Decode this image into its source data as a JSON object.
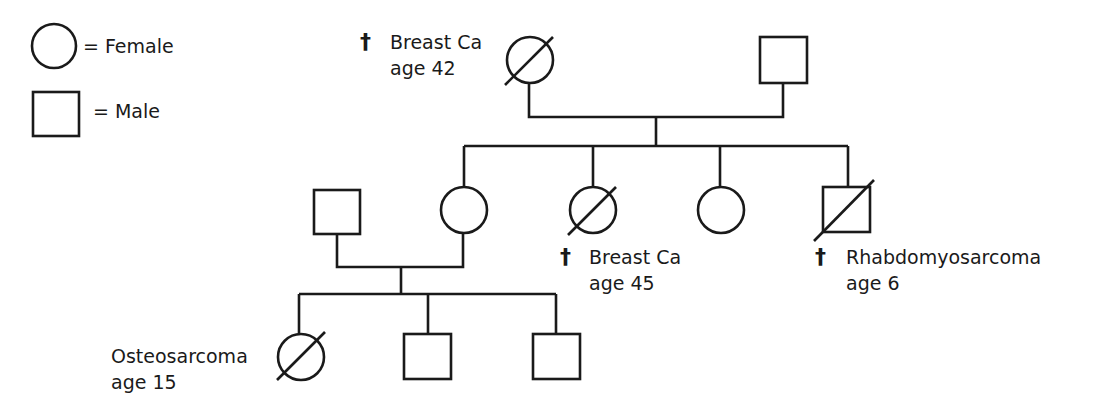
{
  "legend": {
    "female": {
      "symbol": "circle",
      "label": "= Female"
    },
    "male": {
      "symbol": "square",
      "label": "= Male"
    }
  },
  "symbols": {
    "deceased_marker": "†"
  },
  "generations": [
    {
      "id": "I",
      "individuals": [
        {
          "id": "I-1",
          "sex": "female",
          "deceased": true,
          "affected_marker": "slash",
          "label1": "Breast Ca",
          "label2": "age 42"
        },
        {
          "id": "I-2",
          "sex": "male",
          "deceased": false
        }
      ]
    },
    {
      "id": "II",
      "individuals": [
        {
          "id": "II-spouse",
          "sex": "male",
          "deceased": false
        },
        {
          "id": "II-1",
          "sex": "female",
          "deceased": false
        },
        {
          "id": "II-2",
          "sex": "female",
          "deceased": true,
          "label1": "Breast Ca",
          "label2": "age 45"
        },
        {
          "id": "II-3",
          "sex": "female",
          "deceased": false
        },
        {
          "id": "II-4",
          "sex": "male",
          "deceased": true,
          "label1": "Rhabdomyosarcoma",
          "label2": "age 6"
        }
      ]
    },
    {
      "id": "III",
      "individuals": [
        {
          "id": "III-1",
          "sex": "female",
          "deceased": true,
          "label1": "Osteosarcoma",
          "label2": "age 15"
        },
        {
          "id": "III-2",
          "sex": "male",
          "deceased": false
        },
        {
          "id": "III-3",
          "sex": "male",
          "deceased": false
        }
      ]
    }
  ],
  "colors": {
    "line": "#1a1a1a",
    "background": "#ffffff"
  }
}
